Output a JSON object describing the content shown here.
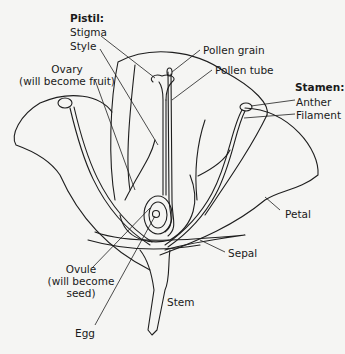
{
  "diagram": {
    "type": "labeled illustration",
    "groups": [
      {
        "heading": "Pistil:",
        "parts": [
          "Stigma",
          "Style",
          "Ovary (will become fruit)"
        ]
      },
      {
        "heading": "Stamen:",
        "parts": [
          "Anther",
          "Filament"
        ]
      }
    ]
  },
  "labels": {
    "pistil_heading": "Pistil:",
    "stigma": "Stigma",
    "style": "Style",
    "ovary_line1": "Ovary",
    "ovary_line2": "(will become fruit)",
    "pollen_grain": "Pollen grain",
    "pollen_tube": "Pollen tube",
    "stamen_heading": "Stamen:",
    "anther": "Anther",
    "filament": "Filament",
    "petal": "Petal",
    "sepal": "Sepal",
    "ovule_line1": "Ovule",
    "ovule_line2": "(will become",
    "ovule_line3": "seed)",
    "stem": "Stem",
    "egg": "Egg"
  }
}
